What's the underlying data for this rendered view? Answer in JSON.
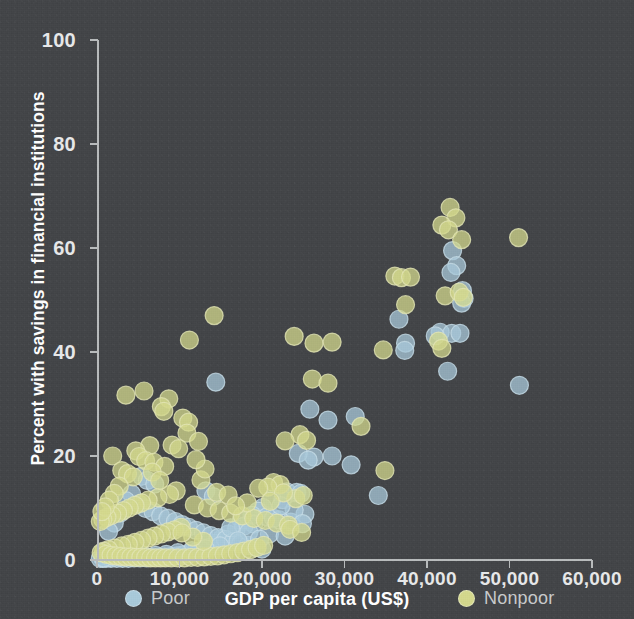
{
  "figure": {
    "background_color": "#434548",
    "axis_color": "#b9bcbd",
    "text_color": "#e8e9ea"
  },
  "axes": {
    "x_title": "GDP per capita (US$)",
    "y_title": "Percent with savings in financial institutions",
    "x_ticks": [
      "0",
      "10,000",
      "20,000",
      "30,000",
      "40,000",
      "50,000",
      "60,000"
    ],
    "y_ticks": [
      "0",
      "20",
      "40",
      "60",
      "80",
      "100"
    ]
  },
  "legend": {
    "poor": {
      "label": "Poor",
      "color": "#a9cadb"
    },
    "nonpoor": {
      "label": "Nonpoor",
      "color": "#d4d98d"
    }
  },
  "chart_data": {
    "type": "scatter",
    "title": "",
    "xlabel": "GDP per capita (US$)",
    "ylabel": "Percent with savings in financial institutions",
    "xlim": [
      0,
      60000
    ],
    "ylim": [
      0,
      100
    ],
    "xticks": [
      0,
      10000,
      20000,
      30000,
      40000,
      50000,
      60000
    ],
    "yticks": [
      0,
      20,
      40,
      60,
      80,
      100
    ],
    "grid": false,
    "legend_position": "below-axis",
    "marker": {
      "shape": "circle",
      "radius_px": 9,
      "opacity": 0.75,
      "edge": "lighter outline"
    },
    "series": [
      {
        "name": "Poor",
        "color": "#a9cadb",
        "points": [
          [
            51200,
            33.6
          ],
          [
            43100,
            59.5
          ],
          [
            43600,
            56.6
          ],
          [
            42900,
            55.3
          ],
          [
            44300,
            51.8
          ],
          [
            44500,
            50.3
          ],
          [
            44200,
            49.4
          ],
          [
            36600,
            46.3
          ],
          [
            37400,
            41.7
          ],
          [
            37300,
            40.3
          ],
          [
            41600,
            43.8
          ],
          [
            43000,
            43.6
          ],
          [
            44000,
            43.6
          ],
          [
            42500,
            36.3
          ],
          [
            41000,
            43.1
          ],
          [
            14400,
            34.2
          ],
          [
            25800,
            29.0
          ],
          [
            28000,
            26.9
          ],
          [
            31300,
            27.6
          ],
          [
            26300,
            19.8
          ],
          [
            28500,
            20.0
          ],
          [
            30800,
            18.3
          ],
          [
            24400,
            20.5
          ],
          [
            25600,
            19.2
          ],
          [
            23000,
            13.1
          ],
          [
            24200,
            13.0
          ],
          [
            24700,
            12.8
          ],
          [
            34100,
            12.4
          ],
          [
            22500,
            11.6
          ],
          [
            21200,
            11.7
          ],
          [
            20100,
            10.1
          ],
          [
            19500,
            9.4
          ],
          [
            18800,
            8.6
          ],
          [
            17500,
            7.6
          ],
          [
            16900,
            6.0
          ],
          [
            15900,
            5.0
          ],
          [
            15100,
            4.1
          ],
          [
            14400,
            3.2
          ],
          [
            13700,
            2.5
          ],
          [
            12800,
            2.0
          ],
          [
            11900,
            1.5
          ],
          [
            11200,
            1.2
          ],
          [
            10400,
            1.0
          ],
          [
            9700,
            0.8
          ],
          [
            9000,
            0.7
          ],
          [
            8200,
            0.6
          ],
          [
            7500,
            0.5
          ],
          [
            6700,
            0.5
          ],
          [
            6000,
            0.4
          ],
          [
            5200,
            0.4
          ],
          [
            4500,
            0.4
          ],
          [
            3800,
            0.3
          ],
          [
            3100,
            0.3
          ],
          [
            2400,
            0.3
          ],
          [
            1700,
            0.3
          ],
          [
            1100,
            0.3
          ],
          [
            700,
            0.3
          ],
          [
            400,
            0.3
          ],
          [
            4200,
            12.7
          ],
          [
            5100,
            10.8
          ],
          [
            5900,
            9.9
          ],
          [
            6800,
            9.3
          ],
          [
            7700,
            8.5
          ],
          [
            8600,
            8.0
          ],
          [
            9500,
            7.4
          ],
          [
            10300,
            6.8
          ],
          [
            11100,
            6.3
          ],
          [
            12000,
            5.7
          ],
          [
            12900,
            5.2
          ],
          [
            13800,
            4.7
          ],
          [
            14700,
            4.3
          ],
          [
            15600,
            3.9
          ],
          [
            16500,
            3.5
          ],
          [
            17400,
            3.1
          ],
          [
            18300,
            2.8
          ],
          [
            19200,
            2.4
          ],
          [
            20000,
            2.1
          ],
          [
            3500,
            11.4
          ],
          [
            2800,
            9.0
          ],
          [
            2100,
            7.1
          ],
          [
            1400,
            5.5
          ],
          [
            5400,
            16.1
          ],
          [
            6100,
            15.3
          ],
          [
            7000,
            14.6
          ],
          [
            13200,
            13.3
          ],
          [
            14100,
            12.2
          ],
          [
            20600,
            8.3
          ],
          [
            21400,
            8.0
          ],
          [
            22100,
            7.7
          ],
          [
            23500,
            7.3
          ],
          [
            19000,
            6.9
          ],
          [
            17800,
            6.5
          ],
          [
            16200,
            6.2
          ],
          [
            18400,
            5.4
          ],
          [
            20900,
            5.0
          ],
          [
            22800,
            4.6
          ],
          [
            19700,
            4.0
          ],
          [
            17100,
            3.7
          ],
          [
            14900,
            2.7
          ],
          [
            13100,
            2.2
          ],
          [
            11500,
            1.8
          ],
          [
            9800,
            1.4
          ],
          [
            8400,
            1.1
          ],
          [
            7100,
            0.9
          ],
          [
            5700,
            0.8
          ],
          [
            4300,
            0.7
          ],
          [
            2900,
            0.6
          ],
          [
            1500,
            0.5
          ],
          [
            800,
            0.4
          ],
          [
            25200,
            8.8
          ],
          [
            23900,
            9.6
          ],
          [
            22300,
            10.4
          ],
          [
            24900,
            7.0
          ]
        ]
      },
      {
        "name": "Nonpoor",
        "color": "#d4d98d",
        "points": [
          [
            42800,
            67.8
          ],
          [
            43500,
            65.8
          ],
          [
            41800,
            64.4
          ],
          [
            42600,
            63.5
          ],
          [
            44200,
            61.6
          ],
          [
            51100,
            62.0
          ],
          [
            36100,
            54.6
          ],
          [
            36900,
            54.3
          ],
          [
            38000,
            54.4
          ],
          [
            37400,
            49.1
          ],
          [
            42200,
            50.8
          ],
          [
            43900,
            51.5
          ],
          [
            44400,
            50.5
          ],
          [
            41400,
            42.1
          ],
          [
            41800,
            40.7
          ],
          [
            34700,
            40.4
          ],
          [
            14200,
            47.0
          ],
          [
            11200,
            42.3
          ],
          [
            23900,
            43.0
          ],
          [
            26300,
            41.7
          ],
          [
            28500,
            41.9
          ],
          [
            26100,
            34.8
          ],
          [
            28000,
            34.0
          ],
          [
            3500,
            31.7
          ],
          [
            5700,
            32.5
          ],
          [
            8700,
            31.0
          ],
          [
            7800,
            29.5
          ],
          [
            8100,
            28.6
          ],
          [
            10400,
            27.3
          ],
          [
            11100,
            26.5
          ],
          [
            10900,
            24.4
          ],
          [
            32000,
            25.7
          ],
          [
            24600,
            24.1
          ],
          [
            25400,
            23.0
          ],
          [
            22800,
            22.9
          ],
          [
            12300,
            22.8
          ],
          [
            9100,
            22.1
          ],
          [
            6400,
            22.0
          ],
          [
            4700,
            21.0
          ],
          [
            1900,
            20.0
          ],
          [
            5100,
            19.9
          ],
          [
            5900,
            19.1
          ],
          [
            6900,
            18.8
          ],
          [
            34900,
            17.2
          ],
          [
            8200,
            18.0
          ],
          [
            3000,
            17.2
          ],
          [
            3700,
            16.6
          ],
          [
            4400,
            16.0
          ],
          [
            12600,
            15.4
          ],
          [
            21400,
            14.9
          ],
          [
            22200,
            14.5
          ],
          [
            20700,
            14.0
          ],
          [
            19600,
            13.8
          ],
          [
            9600,
            13.3
          ],
          [
            8800,
            12.6
          ],
          [
            7400,
            12.0
          ],
          [
            6200,
            11.5
          ],
          [
            5400,
            11.0
          ],
          [
            4600,
            10.5
          ],
          [
            3900,
            10.0
          ],
          [
            3200,
            9.5
          ],
          [
            2500,
            9.0
          ],
          [
            1800,
            8.6
          ],
          [
            1200,
            8.2
          ],
          [
            700,
            7.8
          ],
          [
            400,
            7.4
          ],
          [
            11800,
            10.6
          ],
          [
            13400,
            10.0
          ],
          [
            14800,
            9.5
          ],
          [
            16200,
            9.0
          ],
          [
            17600,
            8.5
          ],
          [
            19000,
            8.0
          ],
          [
            20400,
            7.6
          ],
          [
            21800,
            7.1
          ],
          [
            23200,
            6.7
          ],
          [
            10200,
            6.3
          ],
          [
            9400,
            5.8
          ],
          [
            8600,
            5.4
          ],
          [
            7800,
            5.0
          ],
          [
            7000,
            4.6
          ],
          [
            6200,
            4.2
          ],
          [
            5400,
            3.8
          ],
          [
            4600,
            3.4
          ],
          [
            3800,
            3.0
          ],
          [
            3000,
            2.7
          ],
          [
            2200,
            2.3
          ],
          [
            1400,
            2.0
          ],
          [
            800,
            1.7
          ],
          [
            500,
            1.4
          ],
          [
            1100,
            1.1
          ],
          [
            1700,
            0.9
          ],
          [
            2300,
            0.8
          ],
          [
            2900,
            0.7
          ],
          [
            3500,
            0.6
          ],
          [
            4100,
            0.6
          ],
          [
            4700,
            0.5
          ],
          [
            5300,
            0.5
          ],
          [
            5900,
            0.5
          ],
          [
            6500,
            0.4
          ],
          [
            7100,
            0.4
          ],
          [
            7700,
            0.4
          ],
          [
            8300,
            0.4
          ],
          [
            9000,
            0.4
          ],
          [
            9800,
            0.4
          ],
          [
            10600,
            0.4
          ],
          [
            11400,
            0.5
          ],
          [
            12200,
            0.5
          ],
          [
            13000,
            0.6
          ],
          [
            13800,
            0.7
          ],
          [
            14600,
            0.8
          ],
          [
            15400,
            1.0
          ],
          [
            16200,
            1.2
          ],
          [
            17000,
            1.4
          ],
          [
            17800,
            1.7
          ],
          [
            18600,
            2.0
          ],
          [
            19400,
            2.4
          ],
          [
            20200,
            2.8
          ],
          [
            12900,
            3.6
          ],
          [
            11600,
            4.4
          ],
          [
            10300,
            5.2
          ],
          [
            14500,
            13.0
          ],
          [
            15900,
            12.5
          ],
          [
            13100,
            17.5
          ],
          [
            12000,
            19.3
          ],
          [
            9900,
            21.4
          ],
          [
            24100,
            11.8
          ],
          [
            25000,
            12.4
          ],
          [
            22600,
            12.9
          ],
          [
            21000,
            11.3
          ],
          [
            18200,
            11.0
          ],
          [
            16800,
            10.4
          ],
          [
            6700,
            16.9
          ],
          [
            7600,
            15.3
          ],
          [
            2700,
            14.2
          ],
          [
            2100,
            12.8
          ],
          [
            1500,
            11.5
          ],
          [
            1000,
            10.2
          ],
          [
            600,
            9.3
          ],
          [
            23400,
            5.9
          ],
          [
            24800,
            5.3
          ]
        ]
      }
    ]
  }
}
